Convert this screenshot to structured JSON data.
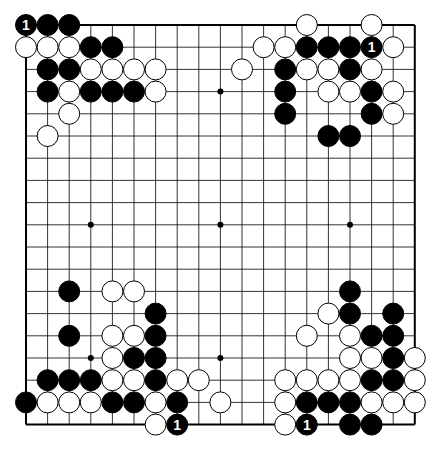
{
  "diagram": {
    "type": "go-board",
    "size": 19,
    "origin": {
      "x": 26,
      "y": 25
    },
    "spacing": {
      "x": 21.6,
      "y": 22.2
    },
    "stone_radius": 10.5,
    "colors": {
      "background": "#ffffff",
      "line": "#000000",
      "black_stone": "#000000",
      "white_stone": "#ffffff",
      "label_on_black": "#ffffff"
    },
    "star_points": [
      [
        3,
        3
      ],
      [
        9,
        3
      ],
      [
        15,
        3
      ],
      [
        3,
        9
      ],
      [
        9,
        9
      ],
      [
        15,
        9
      ],
      [
        3,
        15
      ],
      [
        9,
        15
      ],
      [
        15,
        15
      ]
    ],
    "stones": [
      {
        "c": 0,
        "r": 0,
        "color": "black",
        "label": "1"
      },
      {
        "c": 1,
        "r": 0,
        "color": "black"
      },
      {
        "c": 2,
        "r": 0,
        "color": "black"
      },
      {
        "c": 0,
        "r": 1,
        "color": "white"
      },
      {
        "c": 1,
        "r": 1,
        "color": "white"
      },
      {
        "c": 2,
        "r": 1,
        "color": "white"
      },
      {
        "c": 3,
        "r": 1,
        "color": "black"
      },
      {
        "c": 4,
        "r": 1,
        "color": "black"
      },
      {
        "c": 1,
        "r": 2,
        "color": "black"
      },
      {
        "c": 2,
        "r": 2,
        "color": "black"
      },
      {
        "c": 3,
        "r": 2,
        "color": "white"
      },
      {
        "c": 4,
        "r": 2,
        "color": "white"
      },
      {
        "c": 5,
        "r": 2,
        "color": "white"
      },
      {
        "c": 6,
        "r": 2,
        "color": "white"
      },
      {
        "c": 1,
        "r": 3,
        "color": "black"
      },
      {
        "c": 2,
        "r": 3,
        "color": "white"
      },
      {
        "c": 3,
        "r": 3,
        "color": "black"
      },
      {
        "c": 4,
        "r": 3,
        "color": "black"
      },
      {
        "c": 5,
        "r": 3,
        "color": "black"
      },
      {
        "c": 6,
        "r": 3,
        "color": "white"
      },
      {
        "c": 2,
        "r": 4,
        "color": "white"
      },
      {
        "c": 1,
        "r": 5,
        "color": "white"
      },
      {
        "c": 13,
        "r": 0,
        "color": "white"
      },
      {
        "c": 16,
        "r": 0,
        "color": "white"
      },
      {
        "c": 11,
        "r": 1,
        "color": "white"
      },
      {
        "c": 12,
        "r": 1,
        "color": "white"
      },
      {
        "c": 13,
        "r": 1,
        "color": "black"
      },
      {
        "c": 14,
        "r": 1,
        "color": "black"
      },
      {
        "c": 15,
        "r": 1,
        "color": "black"
      },
      {
        "c": 16,
        "r": 1,
        "color": "black",
        "label": "1"
      },
      {
        "c": 17,
        "r": 1,
        "color": "white"
      },
      {
        "c": 10,
        "r": 2,
        "color": "white"
      },
      {
        "c": 12,
        "r": 2,
        "color": "black"
      },
      {
        "c": 13,
        "r": 2,
        "color": "white"
      },
      {
        "c": 14,
        "r": 2,
        "color": "white"
      },
      {
        "c": 15,
        "r": 2,
        "color": "black"
      },
      {
        "c": 16,
        "r": 2,
        "color": "white"
      },
      {
        "c": 12,
        "r": 3,
        "color": "black"
      },
      {
        "c": 14,
        "r": 3,
        "color": "white"
      },
      {
        "c": 15,
        "r": 3,
        "color": "white"
      },
      {
        "c": 16,
        "r": 3,
        "color": "black"
      },
      {
        "c": 17,
        "r": 3,
        "color": "white"
      },
      {
        "c": 12,
        "r": 4,
        "color": "black"
      },
      {
        "c": 16,
        "r": 4,
        "color": "black"
      },
      {
        "c": 17,
        "r": 4,
        "color": "white"
      },
      {
        "c": 14,
        "r": 5,
        "color": "black"
      },
      {
        "c": 15,
        "r": 5,
        "color": "black"
      },
      {
        "c": 2,
        "r": 12,
        "color": "black"
      },
      {
        "c": 4,
        "r": 12,
        "color": "white"
      },
      {
        "c": 5,
        "r": 12,
        "color": "white"
      },
      {
        "c": 6,
        "r": 13,
        "color": "black"
      },
      {
        "c": 2,
        "r": 14,
        "color": "black"
      },
      {
        "c": 4,
        "r": 14,
        "color": "white"
      },
      {
        "c": 5,
        "r": 14,
        "color": "white"
      },
      {
        "c": 6,
        "r": 14,
        "color": "black"
      },
      {
        "c": 4,
        "r": 15,
        "color": "white"
      },
      {
        "c": 5,
        "r": 15,
        "color": "black"
      },
      {
        "c": 6,
        "r": 15,
        "color": "black"
      },
      {
        "c": 1,
        "r": 16,
        "color": "black"
      },
      {
        "c": 2,
        "r": 16,
        "color": "black"
      },
      {
        "c": 3,
        "r": 16,
        "color": "black"
      },
      {
        "c": 4,
        "r": 16,
        "color": "white"
      },
      {
        "c": 5,
        "r": 16,
        "color": "white"
      },
      {
        "c": 6,
        "r": 16,
        "color": "black"
      },
      {
        "c": 7,
        "r": 16,
        "color": "white"
      },
      {
        "c": 8,
        "r": 16,
        "color": "white"
      },
      {
        "c": 0,
        "r": 17,
        "color": "black"
      },
      {
        "c": 1,
        "r": 17,
        "color": "white"
      },
      {
        "c": 2,
        "r": 17,
        "color": "white"
      },
      {
        "c": 3,
        "r": 17,
        "color": "white"
      },
      {
        "c": 4,
        "r": 17,
        "color": "black"
      },
      {
        "c": 5,
        "r": 17,
        "color": "black"
      },
      {
        "c": 6,
        "r": 17,
        "color": "white"
      },
      {
        "c": 7,
        "r": 17,
        "color": "black"
      },
      {
        "c": 9,
        "r": 17,
        "color": "white"
      },
      {
        "c": 6,
        "r": 18,
        "color": "white"
      },
      {
        "c": 7,
        "r": 18,
        "color": "black",
        "label": "1"
      },
      {
        "c": 15,
        "r": 12,
        "color": "black"
      },
      {
        "c": 14,
        "r": 13,
        "color": "white"
      },
      {
        "c": 15,
        "r": 13,
        "color": "black"
      },
      {
        "c": 17,
        "r": 13,
        "color": "black"
      },
      {
        "c": 13,
        "r": 14,
        "color": "white"
      },
      {
        "c": 15,
        "r": 14,
        "color": "white"
      },
      {
        "c": 16,
        "r": 14,
        "color": "black"
      },
      {
        "c": 17,
        "r": 14,
        "color": "black"
      },
      {
        "c": 15,
        "r": 15,
        "color": "white"
      },
      {
        "c": 16,
        "r": 15,
        "color": "white"
      },
      {
        "c": 17,
        "r": 15,
        "color": "black"
      },
      {
        "c": 18,
        "r": 15,
        "color": "white"
      },
      {
        "c": 12,
        "r": 16,
        "color": "white"
      },
      {
        "c": 13,
        "r": 16,
        "color": "white"
      },
      {
        "c": 14,
        "r": 16,
        "color": "white"
      },
      {
        "c": 15,
        "r": 16,
        "color": "white"
      },
      {
        "c": 16,
        "r": 16,
        "color": "black"
      },
      {
        "c": 17,
        "r": 16,
        "color": "black"
      },
      {
        "c": 18,
        "r": 16,
        "color": "white"
      },
      {
        "c": 12,
        "r": 17,
        "color": "white"
      },
      {
        "c": 13,
        "r": 17,
        "color": "black"
      },
      {
        "c": 14,
        "r": 17,
        "color": "black"
      },
      {
        "c": 15,
        "r": 17,
        "color": "black"
      },
      {
        "c": 16,
        "r": 17,
        "color": "white"
      },
      {
        "c": 17,
        "r": 17,
        "color": "white"
      },
      {
        "c": 18,
        "r": 17,
        "color": "white"
      },
      {
        "c": 12,
        "r": 18,
        "color": "white"
      },
      {
        "c": 13,
        "r": 18,
        "color": "black",
        "label": "1"
      },
      {
        "c": 15,
        "r": 18,
        "color": "black"
      },
      {
        "c": 16,
        "r": 18,
        "color": "black"
      }
    ]
  }
}
